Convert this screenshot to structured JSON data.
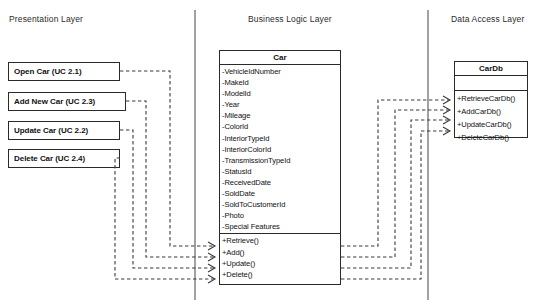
{
  "diagram": {
    "kind": "layered-class-diagram",
    "background_color": "#ffffff",
    "line_color": "#3a3a3a"
  },
  "layers": [
    {
      "id": "presentation",
      "label": "Presentation Layer"
    },
    {
      "id": "business",
      "label": "Business Logic Layer"
    },
    {
      "id": "data_access",
      "label": "Data Access Layer"
    }
  ],
  "use_cases": [
    {
      "id": "open",
      "label": "Open Car (UC 2.1)"
    },
    {
      "id": "addnew",
      "label": "Add New Car (UC 2.3)"
    },
    {
      "id": "update",
      "label": "Update Car (UC 2.2)"
    },
    {
      "id": "delete",
      "label": "Delete Car (UC 2.4)"
    }
  ],
  "car_class": {
    "name": "Car",
    "attributes": [
      "-VehicleIdNumber",
      "-MakeId",
      "-ModelId",
      "-Year",
      "-Mileage",
      "-ColorId",
      "-InteriorTypeId",
      "-InteriorColorId",
      "-TransmissionTypeId",
      "-StatusId",
      "-ReceivedDate",
      "-SoldDate",
      "-SoldToCustomerId",
      "-Photo",
      "-Special Features"
    ],
    "operations": [
      "+Retrieve()",
      "+Add()",
      "+Update()",
      "+Delete()"
    ]
  },
  "cardb_class": {
    "name": "CarDb",
    "attributes": [],
    "operations": [
      "+RetrieveCarDb()",
      "+AddCarDb()",
      "+UpdateCarDb()",
      "+DeleteCarDb()"
    ]
  },
  "dependencies": [
    {
      "from": "open",
      "to": "+Retrieve()"
    },
    {
      "from": "addnew",
      "to": "+Add()"
    },
    {
      "from": "update",
      "to": "+Update()"
    },
    {
      "from": "delete",
      "to": "+Delete()"
    },
    {
      "from": "+Retrieve()",
      "to": "+RetrieveCarDb()"
    },
    {
      "from": "+Add()",
      "to": "+AddCarDb()"
    },
    {
      "from": "+Update()",
      "to": "+UpdateCarDb()"
    },
    {
      "from": "+Delete()",
      "to": "+DeleteCarDb()"
    }
  ]
}
